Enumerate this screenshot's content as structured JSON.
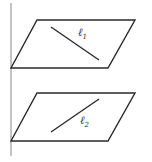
{
  "diagram": {
    "colors": {
      "background": "#ffffff",
      "stroke": "#2a2a2a",
      "axis": "#888888"
    },
    "axis": {
      "x": 11,
      "y1": 3,
      "y2": 156
    },
    "planes": [
      {
        "name": "upper-plane",
        "points": [
          [
            37,
            20
          ],
          [
            135,
            20
          ],
          [
            108,
            68
          ],
          [
            11,
            68
          ]
        ],
        "line": {
          "name": "l1",
          "x1": 51,
          "y1": 27,
          "x2": 99,
          "y2": 60
        },
        "label": {
          "base": "ℓ",
          "subscript": "1",
          "x": 78,
          "y": 36
        }
      },
      {
        "name": "lower-plane",
        "points": [
          [
            37,
            93
          ],
          [
            135,
            93
          ],
          [
            108,
            141
          ],
          [
            11,
            141
          ]
        ],
        "line": {
          "name": "l2",
          "x1": 51,
          "y1": 132,
          "x2": 99,
          "y2": 99
        },
        "label": {
          "base": "ℓ",
          "subscript": "2",
          "x": 80,
          "y": 124
        }
      }
    ]
  }
}
